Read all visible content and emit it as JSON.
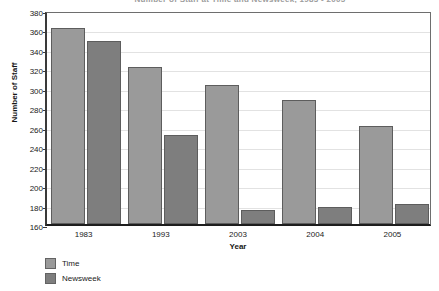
{
  "chart_data": {
    "type": "bar",
    "title": "Number of Staff at Time and Newsweek, 1983 - 2005",
    "xlabel": "Year",
    "ylabel": "Number of Staff",
    "categories": [
      "1983",
      "1993",
      "2003",
      "2004",
      "2005"
    ],
    "series": [
      {
        "name": "Time",
        "color": "#9a9a9a",
        "values": [
          362,
          321,
          303,
          288,
          261
        ]
      },
      {
        "name": "Newsweek",
        "color": "#7e7e7e",
        "values": [
          348,
          251,
          174,
          178,
          181
        ]
      }
    ],
    "ylim": [
      160,
      380
    ],
    "ytick_step": 20,
    "yticks": [
      160,
      180,
      200,
      220,
      240,
      260,
      280,
      300,
      320,
      340,
      360,
      380
    ],
    "grid": true,
    "legend_position": "bottom-left"
  },
  "colors": {
    "series_time": "#9a9a9a",
    "series_newsweek": "#7e7e7e",
    "axis": "#1d1d1d",
    "gridline": "#e2e2e2",
    "background": "#ffffff"
  }
}
